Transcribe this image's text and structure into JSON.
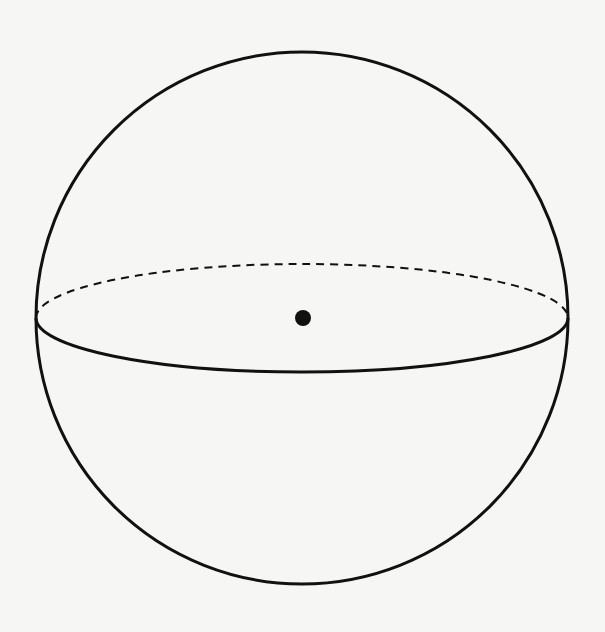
{
  "diagram": {
    "type": "sphere",
    "background_color": "#f6f6f4",
    "stroke_color": "#111111",
    "sphere": {
      "cx": 302,
      "cy": 318,
      "r": 266
    },
    "equator": {
      "cx": 302,
      "cy": 318,
      "rx": 266,
      "ry": 54,
      "back_dash": "8 6"
    },
    "center_point": {
      "cx": 303,
      "cy": 318,
      "r": 8
    },
    "labels": []
  }
}
